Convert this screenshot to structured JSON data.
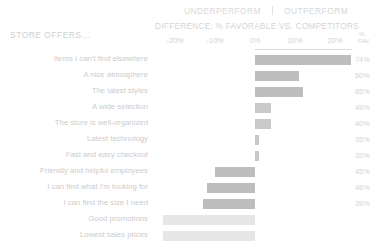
{
  "header": {
    "underperform": "UNDERPERFORM",
    "outperform": "OUTPERFORM",
    "difference_title": "DIFFERENCE: % FAVORABLE VS. COMPETITORS",
    "category_label": "STORE OFFERS...",
    "fav_pct_symbol": "%",
    "fav_word": "FAV"
  },
  "axis": {
    "ticks": [
      "-20%",
      "-10%",
      "0%",
      "10%",
      "20%"
    ],
    "tick_values": [
      -20,
      -10,
      0,
      10,
      20
    ]
  },
  "colors": {
    "bar_strong": "#bdbdbd",
    "bar_medium": "#c9c9c9",
    "bar_faint": "#e6e6e6",
    "text": "#cccccc",
    "rule": "#dcdcdc"
  },
  "chart_data": {
    "type": "bar",
    "title": "DIFFERENCE: % FAVORABLE VS. COMPETITORS",
    "subtitle": "UNDERPERFORM | OUTPERFORM",
    "xlabel": "DIFFERENCE: % FAVORABLE VS. COMPETITORS",
    "ylabel": "STORE OFFERS...",
    "xlim": [
      -25,
      25
    ],
    "xticks": [
      -20,
      -10,
      0,
      10,
      20
    ],
    "grid": false,
    "legend": "none",
    "orientation": "horizontal-diverging",
    "categories": [
      "Items I can't find elsewhere",
      "A nice atmosphere",
      "The latest styles",
      "A wide selection",
      "The store is well-organized",
      "Latest technology",
      "Fast and easy checkout",
      "Friendly and helpful employees",
      "I can find what I'm looking for",
      "I can find the size I need",
      "Good promotions",
      "Lowest sales prices"
    ],
    "values": [
      24,
      11,
      12,
      4,
      4,
      1,
      1,
      -10,
      -12,
      -13,
      -23,
      -23
    ],
    "secondary_series": {
      "name": "% FAV",
      "values": [
        "74%",
        "60%",
        "65%",
        "49%",
        "40%",
        "35%",
        "33%",
        "45%",
        "46%",
        "39%",
        "",
        ""
      ]
    }
  }
}
